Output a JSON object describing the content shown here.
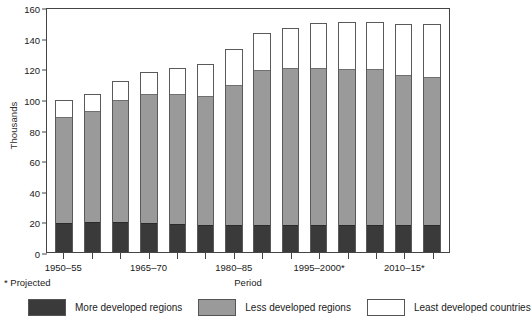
{
  "chart_data": {
    "type": "bar",
    "stacked": true,
    "title": "",
    "xlabel": "Period",
    "ylabel": "Thousands",
    "ylim": [
      0,
      160
    ],
    "yticks": [
      0,
      20,
      40,
      60,
      80,
      100,
      120,
      140,
      160
    ],
    "grid": false,
    "legend_position": "bottom",
    "footnote": "* Projected",
    "categories": [
      "1950–55",
      "1955–60",
      "1960–65",
      "1965–70",
      "1970–75",
      "1975–80",
      "1980–85",
      "1985–90",
      "1990–95",
      "1995–2000*",
      "2000–05*",
      "2005–10*",
      "2010–15*",
      "2015–20*"
    ],
    "tick_labels_shown": [
      "1950–55",
      "1965–70",
      "1980–85",
      "1995–2000*",
      "2010–15*"
    ],
    "series": [
      {
        "name": "More developed regions",
        "color": "#3a3a3a",
        "values": [
          19,
          19.5,
          19.5,
          19,
          18.5,
          17.5,
          17.5,
          18,
          18,
          18,
          18,
          18,
          18,
          18
        ]
      },
      {
        "name": "Less developed regions",
        "color": "#9a9a9a",
        "values": [
          70,
          73,
          80.5,
          85,
          85.5,
          85,
          92,
          101.5,
          103,
          102.5,
          102,
          102,
          98,
          97
        ]
      },
      {
        "name": "Least developed countries",
        "color": "#ffffff",
        "values": [
          10,
          11,
          12,
          13.5,
          16,
          20,
          23,
          23.5,
          25.5,
          29,
          30,
          30,
          33,
          34
        ]
      }
    ],
    "totals": [
      99,
      103.5,
      112,
      117.5,
      120,
      122.5,
      132.5,
      143,
      146.5,
      149.5,
      150,
      150,
      149,
      149
    ]
  },
  "legend": {
    "items": [
      {
        "label": "More developed regions",
        "swatch": "more"
      },
      {
        "label": "Less developed regions",
        "swatch": "less"
      },
      {
        "label": "Least developed countries",
        "swatch": "least"
      }
    ]
  }
}
